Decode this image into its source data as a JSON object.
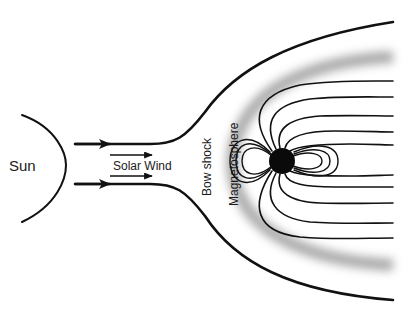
{
  "diagram": {
    "labels": {
      "sun": "Sun",
      "solar_wind": "Solar Wind",
      "bow_shock": "Bow shock",
      "magnetosphere": "Magnetosphere"
    },
    "colors": {
      "line": "#111111",
      "earth": "#0a0a0a",
      "shock_band": "#9a9a9a",
      "background": "#ffffff"
    },
    "elements": [
      "sun-limb",
      "solar-wind-flow-arrows",
      "solar-wind-label-arrows",
      "bow-shock-boundary",
      "magnetosheath-band",
      "earth",
      "dipole-field-lines",
      "magnetotail-field-lines"
    ]
  }
}
